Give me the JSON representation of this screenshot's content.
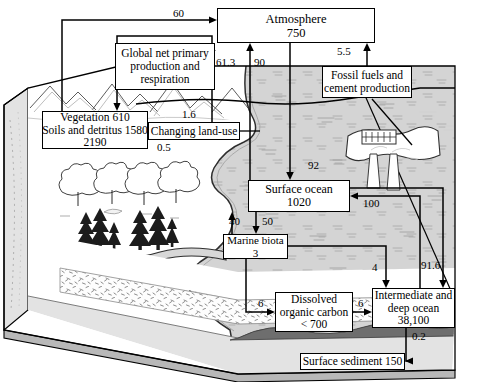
{
  "figure": {
    "units_note": "",
    "palette": {
      "land_top": "#e6e6e6",
      "land_side": "#d9d9d9",
      "ocean_water": "#d2d2d2",
      "sediment_dark": "#6e6e6e",
      "sand_band": "#fbfbfb",
      "line": "#000000",
      "box_fill": "#ffffff"
    }
  },
  "boxes": [
    {
      "id": "atmosphere",
      "lines": [
        "Atmosphere",
        "750"
      ],
      "x": 217,
      "y": 8,
      "w": 158,
      "h": 35,
      "fs": 12.5
    },
    {
      "id": "gnpp",
      "lines": [
        "Global net primary",
        "production and",
        "respiration"
      ],
      "x": 115,
      "y": 43,
      "w": 100,
      "h": 47,
      "fs": 11.5
    },
    {
      "id": "vegetation",
      "lines": [
        "Vegetation 610",
        "Soils and detritus 1580",
        "2190"
      ],
      "x": 42,
      "y": 111,
      "w": 106,
      "h": 38,
      "fs": 11.5
    },
    {
      "id": "landuse",
      "lines": [
        "Changing land-use"
      ],
      "x": 148,
      "y": 122,
      "w": 92,
      "h": 18,
      "fs": 11.5
    },
    {
      "id": "fossilfuels",
      "lines": [
        "Fossil fuels and",
        "cement production"
      ],
      "x": 322,
      "y": 66,
      "w": 90,
      "h": 32,
      "fs": 11.5
    },
    {
      "id": "surfaceocean",
      "lines": [
        "Surface ocean",
        "1020"
      ],
      "x": 248,
      "y": 180,
      "w": 102,
      "h": 32,
      "fs": 12
    },
    {
      "id": "marinebiota",
      "lines": [
        "Marine biota",
        "3"
      ],
      "x": 223,
      "y": 234,
      "w": 65,
      "h": 25,
      "fs": 11
    },
    {
      "id": "doc",
      "lines": [
        "Dissolved",
        "organic carbon",
        "< 700"
      ],
      "x": 275,
      "y": 292,
      "w": 78,
      "h": 40,
      "fs": 11.5
    },
    {
      "id": "deepocean",
      "lines": [
        "Intermediate and",
        "deep ocean",
        "38,100"
      ],
      "x": 372,
      "y": 288,
      "w": 83,
      "h": 40,
      "fs": 11.5
    },
    {
      "id": "sediment",
      "lines": [
        "Surface sediment 150"
      ],
      "x": 300,
      "y": 353,
      "w": 105,
      "h": 17,
      "fs": 11.5
    }
  ],
  "fluxes": [
    {
      "id": "f-60",
      "label": "60",
      "x": 173,
      "y": 8
    },
    {
      "id": "f-613",
      "label": "61.3",
      "x": 216,
      "y": 57
    },
    {
      "id": "f-90",
      "label": "90",
      "x": 254,
      "y": 57
    },
    {
      "id": "f-55",
      "label": "5.5",
      "x": 337,
      "y": 46
    },
    {
      "id": "f-16",
      "label": "1.6",
      "x": 182,
      "y": 109
    },
    {
      "id": "f-05",
      "label": "0.5",
      "x": 157,
      "y": 142
    },
    {
      "id": "f-92",
      "label": "92",
      "x": 308,
      "y": 160
    },
    {
      "id": "f-40",
      "label": "40",
      "x": 229,
      "y": 216
    },
    {
      "id": "f-50",
      "label": "50",
      "x": 262,
      "y": 216
    },
    {
      "id": "f-100",
      "label": "100",
      "x": 363,
      "y": 198
    },
    {
      "id": "f-4",
      "label": "4",
      "x": 372,
      "y": 262
    },
    {
      "id": "f-916",
      "label": "91.6",
      "x": 421,
      "y": 260
    },
    {
      "id": "f-6a",
      "label": "6",
      "x": 258,
      "y": 298
    },
    {
      "id": "f-6b",
      "label": "6",
      "x": 358,
      "y": 298
    },
    {
      "id": "f-02",
      "label": "0.2",
      "x": 412,
      "y": 331
    }
  ],
  "arrows": [
    {
      "id": "a-veg-to-atm-60",
      "from": "vegetation",
      "to": "atmosphere",
      "label": "60"
    },
    {
      "id": "a-gnpp-to-atm-61-3",
      "from": "gnpp",
      "to": "atmosphere",
      "label": "61.3"
    },
    {
      "id": "a-surfocean-to-atm-90",
      "from": "surface ocean",
      "to": "atmosphere",
      "label": "90"
    },
    {
      "id": "a-fossil-to-atm-5-5",
      "from": "fossil fuels",
      "to": "atmosphere",
      "label": "5.5"
    },
    {
      "id": "a-gnpp-to-veg",
      "from": "gnpp",
      "to": "vegetation",
      "label": ""
    },
    {
      "id": "a-landuse-to-gnpp-1-6",
      "from": "changing land-use",
      "to": "gnpp",
      "label": "1.6"
    },
    {
      "id": "a-landuse-to-veg-0-5",
      "from": "changing land-use",
      "to": "vegetation",
      "label": "0.5"
    },
    {
      "id": "a-atm-to-surfocean-92",
      "from": "atmosphere",
      "to": "surface ocean",
      "label": "92"
    },
    {
      "id": "a-biota-to-surf-40",
      "from": "marine biota",
      "to": "surface ocean",
      "label": "40"
    },
    {
      "id": "a-surf-to-biota-50",
      "from": "surface ocean",
      "to": "marine biota",
      "label": "50"
    },
    {
      "id": "a-deep-to-surf-100",
      "from": "intermediate and deep ocean",
      "to": "surface ocean",
      "label": "100"
    },
    {
      "id": "a-surf-to-deep-91-6",
      "from": "surface ocean",
      "to": "intermediate and deep ocean",
      "label": "91.6"
    },
    {
      "id": "a-biota-to-deep-4",
      "from": "marine biota",
      "to": "intermediate and deep ocean",
      "label": "4"
    },
    {
      "id": "a-biota-to-doc-6",
      "from": "marine biota",
      "to": "dissolved organic carbon",
      "label": "6"
    },
    {
      "id": "a-doc-to-deep-6",
      "from": "dissolved organic carbon",
      "to": "intermediate and deep ocean",
      "label": "6"
    },
    {
      "id": "a-deep-to-sediment-0-2",
      "from": "intermediate and deep ocean",
      "to": "surface sediment",
      "label": "0.2"
    }
  ]
}
